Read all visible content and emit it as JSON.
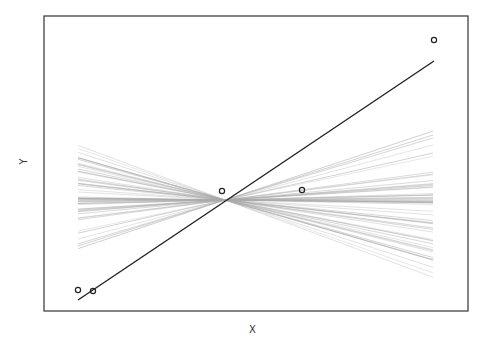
{
  "chart_data": {
    "type": "line",
    "title": "",
    "xlabel": "X",
    "ylabel": "Y",
    "grid": false,
    "legend": null,
    "axes_visible": false,
    "points": {
      "marker": "open-circle",
      "color": "#222222",
      "x": [
        0.0,
        0.04,
        0.41,
        0.63,
        1.0
      ],
      "y": [
        0.01,
        0.0,
        0.4,
        0.4,
        1.0
      ]
    },
    "regression_line": {
      "color": "#222222",
      "x": [
        0.0,
        1.0
      ],
      "y": [
        -0.04,
        0.92
      ]
    },
    "fan_lines": {
      "description": "Many light gray lines pivoting through a common point, representing randomized/permuted slope fits",
      "color": "#aaaaaa",
      "count": 60,
      "pivot": {
        "x": 0.41,
        "y": 0.36
      },
      "x_range": [
        0.0,
        1.0
      ],
      "left_y_range": [
        0.13,
        0.58
      ],
      "right_y_range": [
        0.04,
        0.68
      ]
    }
  },
  "labels": {
    "x": "X",
    "y": "Y"
  },
  "layout": {
    "frame": {
      "left": 44,
      "top": 16,
      "right": 468,
      "bottom": 311
    },
    "px_points": [
      [
        78,
        290
      ],
      [
        93,
        291
      ],
      [
        222,
        191
      ],
      [
        302,
        190
      ],
      [
        434,
        40
      ]
    ],
    "px_regression": [
      [
        78,
        300
      ],
      [
        434,
        61
      ]
    ],
    "px_pivot": [
      225,
      200
    ],
    "px_fan_left_x": 78,
    "px_fan_right_x": 433,
    "px_fan_left_y_range": [
      144,
      258
    ],
    "px_fan_right_y_range": [
      120,
      279
    ]
  }
}
